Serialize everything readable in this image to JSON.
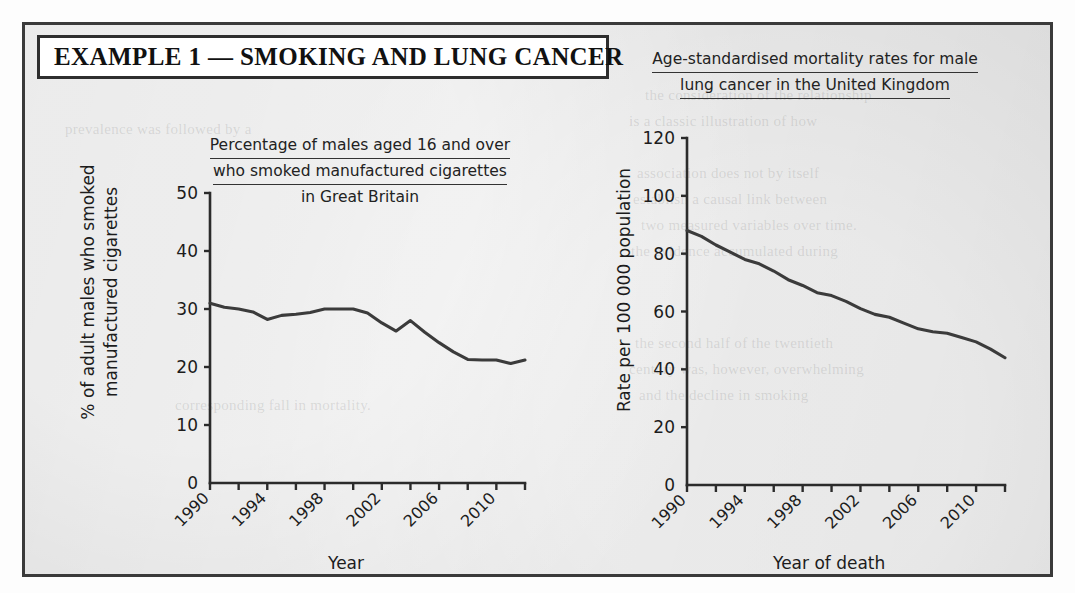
{
  "page": {
    "background_color": "#e3e3e3",
    "border_color": "#3a3a3a"
  },
  "title_box": {
    "text": "EXAMPLE 1 — SMOKING AND LUNG CANCER"
  },
  "ghost_text": [
    "the consideration of the relationship",
    "is a classic illustration of how",
    "association does not by itself",
    "establish a causal link between",
    "two measured variables over time.",
    "the evidence accumulated during",
    "the second half of the twentieth",
    "century was, however, overwhelming",
    "and the decline in smoking",
    "prevalence was followed by a",
    "corresponding fall in mortality."
  ],
  "chart_data": [
    {
      "id": "smoking",
      "type": "line",
      "title": "Percentage of males aged 16 and over who smoked manufactured cigarettes in Great Britain",
      "title_lines": [
        "Percentage of males aged 16 and over",
        "who smoked manufactured cigarettes",
        "in Great Britain"
      ],
      "xlabel": "Year",
      "ylabel": "% of adult males who smoked manufactured cigarettes",
      "ylabel_lines": [
        "% of adult males who smoked",
        "manufactured cigarettes"
      ],
      "xlim": [
        1990,
        2012
      ],
      "ylim": [
        0,
        50
      ],
      "yticks": [
        0,
        10,
        20,
        30,
        40,
        50
      ],
      "ytick_labels": [
        "0",
        "10",
        "20",
        "30",
        "40",
        "50"
      ],
      "xticks": [
        1990,
        1992,
        1994,
        1996,
        1998,
        2000,
        2002,
        2004,
        2006,
        2008,
        2010,
        2012
      ],
      "xtick_labels": [
        "1990",
        "",
        "1994",
        "",
        "1998",
        "",
        "2002",
        "",
        "2006",
        "",
        "2010",
        ""
      ],
      "grid": false,
      "legend": "none",
      "line_color": "#3b3b3b",
      "x": [
        1990,
        1991,
        1992,
        1993,
        1994,
        1995,
        1996,
        1997,
        1998,
        1999,
        2000,
        2001,
        2002,
        2003,
        2004,
        2005,
        2006,
        2007,
        2008,
        2009,
        2010,
        2011,
        2012
      ],
      "values": [
        31.0,
        30.3,
        30.0,
        29.5,
        28.2,
        28.9,
        29.1,
        29.4,
        30.0,
        30.0,
        30.0,
        29.3,
        27.6,
        26.2,
        28.0,
        26.0,
        24.2,
        22.6,
        21.3,
        21.2,
        21.2,
        20.6,
        21.2
      ]
    },
    {
      "id": "mortality",
      "type": "line",
      "title": "Age-standardised mortality rates for male lung cancer in the United Kingdom",
      "title_lines": [
        "Age-standardised mortality rates for male",
        "lung cancer in the United Kingdom"
      ],
      "xlabel": "Year of death",
      "ylabel": "Rate per 100 000 population",
      "ylabel_lines": [
        "Rate per 100 000 population"
      ],
      "xlim": [
        1990,
        2012
      ],
      "ylim": [
        0,
        120
      ],
      "yticks": [
        0,
        20,
        40,
        60,
        80,
        100,
        120
      ],
      "ytick_labels": [
        "0",
        "20",
        "40",
        "60",
        "80",
        "100",
        "120"
      ],
      "xticks": [
        1990,
        1992,
        1994,
        1996,
        1998,
        2000,
        2002,
        2004,
        2006,
        2008,
        2010,
        2012
      ],
      "xtick_labels": [
        "1990",
        "",
        "1994",
        "",
        "1998",
        "",
        "2002",
        "",
        "2006",
        "",
        "2010",
        ""
      ],
      "grid": false,
      "legend": "none",
      "line_color": "#3b3b3b",
      "x": [
        1990,
        1991,
        1992,
        1993,
        1994,
        1995,
        1996,
        1997,
        1998,
        1999,
        2000,
        2001,
        2002,
        2003,
        2004,
        2005,
        2006,
        2007,
        2008,
        2009,
        2010,
        2011,
        2012
      ],
      "values": [
        88.0,
        86.0,
        83.0,
        80.5,
        78.0,
        76.5,
        74.0,
        71.0,
        69.0,
        66.5,
        65.5,
        63.5,
        61.0,
        59.0,
        58.0,
        56.0,
        54.0,
        53.0,
        52.5,
        51.0,
        49.5,
        47.0,
        44.0
      ]
    }
  ]
}
